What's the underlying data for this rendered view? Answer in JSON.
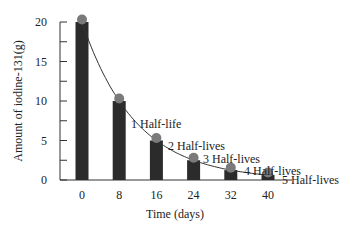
{
  "chart_data": {
    "type": "bar",
    "title": "",
    "xlabel": "Time (days)",
    "ylabel": "Amount of iodine-131(g)",
    "categories": [
      "0",
      "8",
      "16",
      "24",
      "32",
      "40"
    ],
    "x": [
      0,
      8,
      16,
      24,
      32,
      40
    ],
    "values": [
      20,
      10,
      5,
      2.5,
      1.25,
      0.625
    ],
    "ylim": [
      0,
      20
    ],
    "yticks": [
      0,
      5,
      10,
      15,
      20
    ],
    "minor_yticks": [
      2.5,
      7.5,
      12.5,
      17.5
    ],
    "grid": false,
    "legend": null,
    "overlay": {
      "type": "decay-curve",
      "marker": "circle",
      "marker_color": "#7a7a7a"
    },
    "annotations": [
      {
        "text": "1 Half-life",
        "x": 8,
        "y": 10
      },
      {
        "text": "2 Half-lives",
        "x": 16,
        "y": 5
      },
      {
        "text": "3 Half-lives",
        "x": 24,
        "y": 2.5
      },
      {
        "text": "4 Half-lives",
        "x": 32,
        "y": 1.25
      },
      {
        "text": "5 Half-lives",
        "x": 40,
        "y": 0.625
      }
    ],
    "colors": {
      "bar": "#2b2b2b",
      "marker": "#7a7a7a",
      "curve": "#333333",
      "axis": "#333333"
    }
  }
}
